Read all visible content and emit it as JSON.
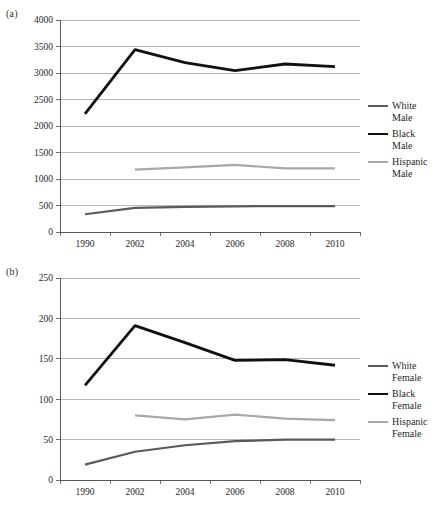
{
  "figure": {
    "background": "#ffffff",
    "panels": [
      "a",
      "b"
    ]
  },
  "panel_a": {
    "label": "(a)",
    "legend": [
      {
        "name": "White Male",
        "text": "White\nMale",
        "color": "#5a5a5a",
        "width": 2.2
      },
      {
        "name": "Black Male",
        "text": "Black\nMale",
        "color": "#111111",
        "width": 2.8
      },
      {
        "name": "Hispanic Male",
        "text": "Hispanic\nMale",
        "color": "#a8a8a8",
        "width": 2.2
      }
    ]
  },
  "panel_b": {
    "label": "(b)",
    "legend": [
      {
        "name": "White Female",
        "text": "White\nFemale",
        "color": "#5a5a5a",
        "width": 2.2
      },
      {
        "name": "Black Female",
        "text": "Black\nFemale",
        "color": "#111111",
        "width": 2.8
      },
      {
        "name": "Hispanic Female",
        "text": "Hispanic\nFemale",
        "color": "#a8a8a8",
        "width": 2.2
      }
    ]
  },
  "chart_data": [
    {
      "id": "panel-a",
      "type": "line",
      "title": "(a)",
      "xlabel": "",
      "ylabel": "",
      "categories": [
        "1990",
        "2002",
        "2004",
        "2006",
        "2008",
        "2010"
      ],
      "ylim": [
        0,
        4000
      ],
      "yticks": [
        0,
        500,
        1000,
        1500,
        2000,
        2500,
        3000,
        3500,
        4000
      ],
      "ytick_labels": [
        "0",
        "500",
        "1000",
        "1500",
        "2000",
        "2500",
        "3000",
        "3500",
        "4000"
      ],
      "grid": true,
      "legend_position": "right",
      "series": [
        {
          "name": "White Male",
          "color": "#5a5a5a",
          "width": 2.2,
          "values": [
            335,
            455,
            475,
            485,
            490,
            490
          ]
        },
        {
          "name": "Black Male",
          "color": "#111111",
          "width": 2.8,
          "values": [
            2230,
            3440,
            3195,
            3045,
            3170,
            3120
          ]
        },
        {
          "name": "Hispanic Male",
          "color": "#a8a8a8",
          "width": 2.2,
          "values": [
            null,
            1175,
            1220,
            1265,
            1200,
            1200
          ]
        }
      ]
    },
    {
      "id": "panel-b",
      "type": "line",
      "title": "(b)",
      "xlabel": "",
      "ylabel": "",
      "categories": [
        "1990",
        "2002",
        "2004",
        "2006",
        "2008",
        "2010"
      ],
      "ylim": [
        0,
        250
      ],
      "yticks": [
        0,
        50,
        100,
        150,
        200,
        250
      ],
      "ytick_labels": [
        "0",
        "50",
        "100",
        "150",
        "200",
        "250"
      ],
      "grid": true,
      "legend_position": "right",
      "series": [
        {
          "name": "White Female",
          "color": "#5a5a5a",
          "width": 2.2,
          "values": [
            19,
            35,
            43,
            48,
            50,
            50
          ]
        },
        {
          "name": "Black Female",
          "color": "#111111",
          "width": 2.8,
          "values": [
            117,
            191,
            170,
            148,
            149,
            142
          ]
        },
        {
          "name": "Hispanic Female",
          "color": "#a8a8a8",
          "width": 2.2,
          "values": [
            null,
            80,
            75,
            81,
            76,
            74
          ]
        }
      ]
    }
  ]
}
